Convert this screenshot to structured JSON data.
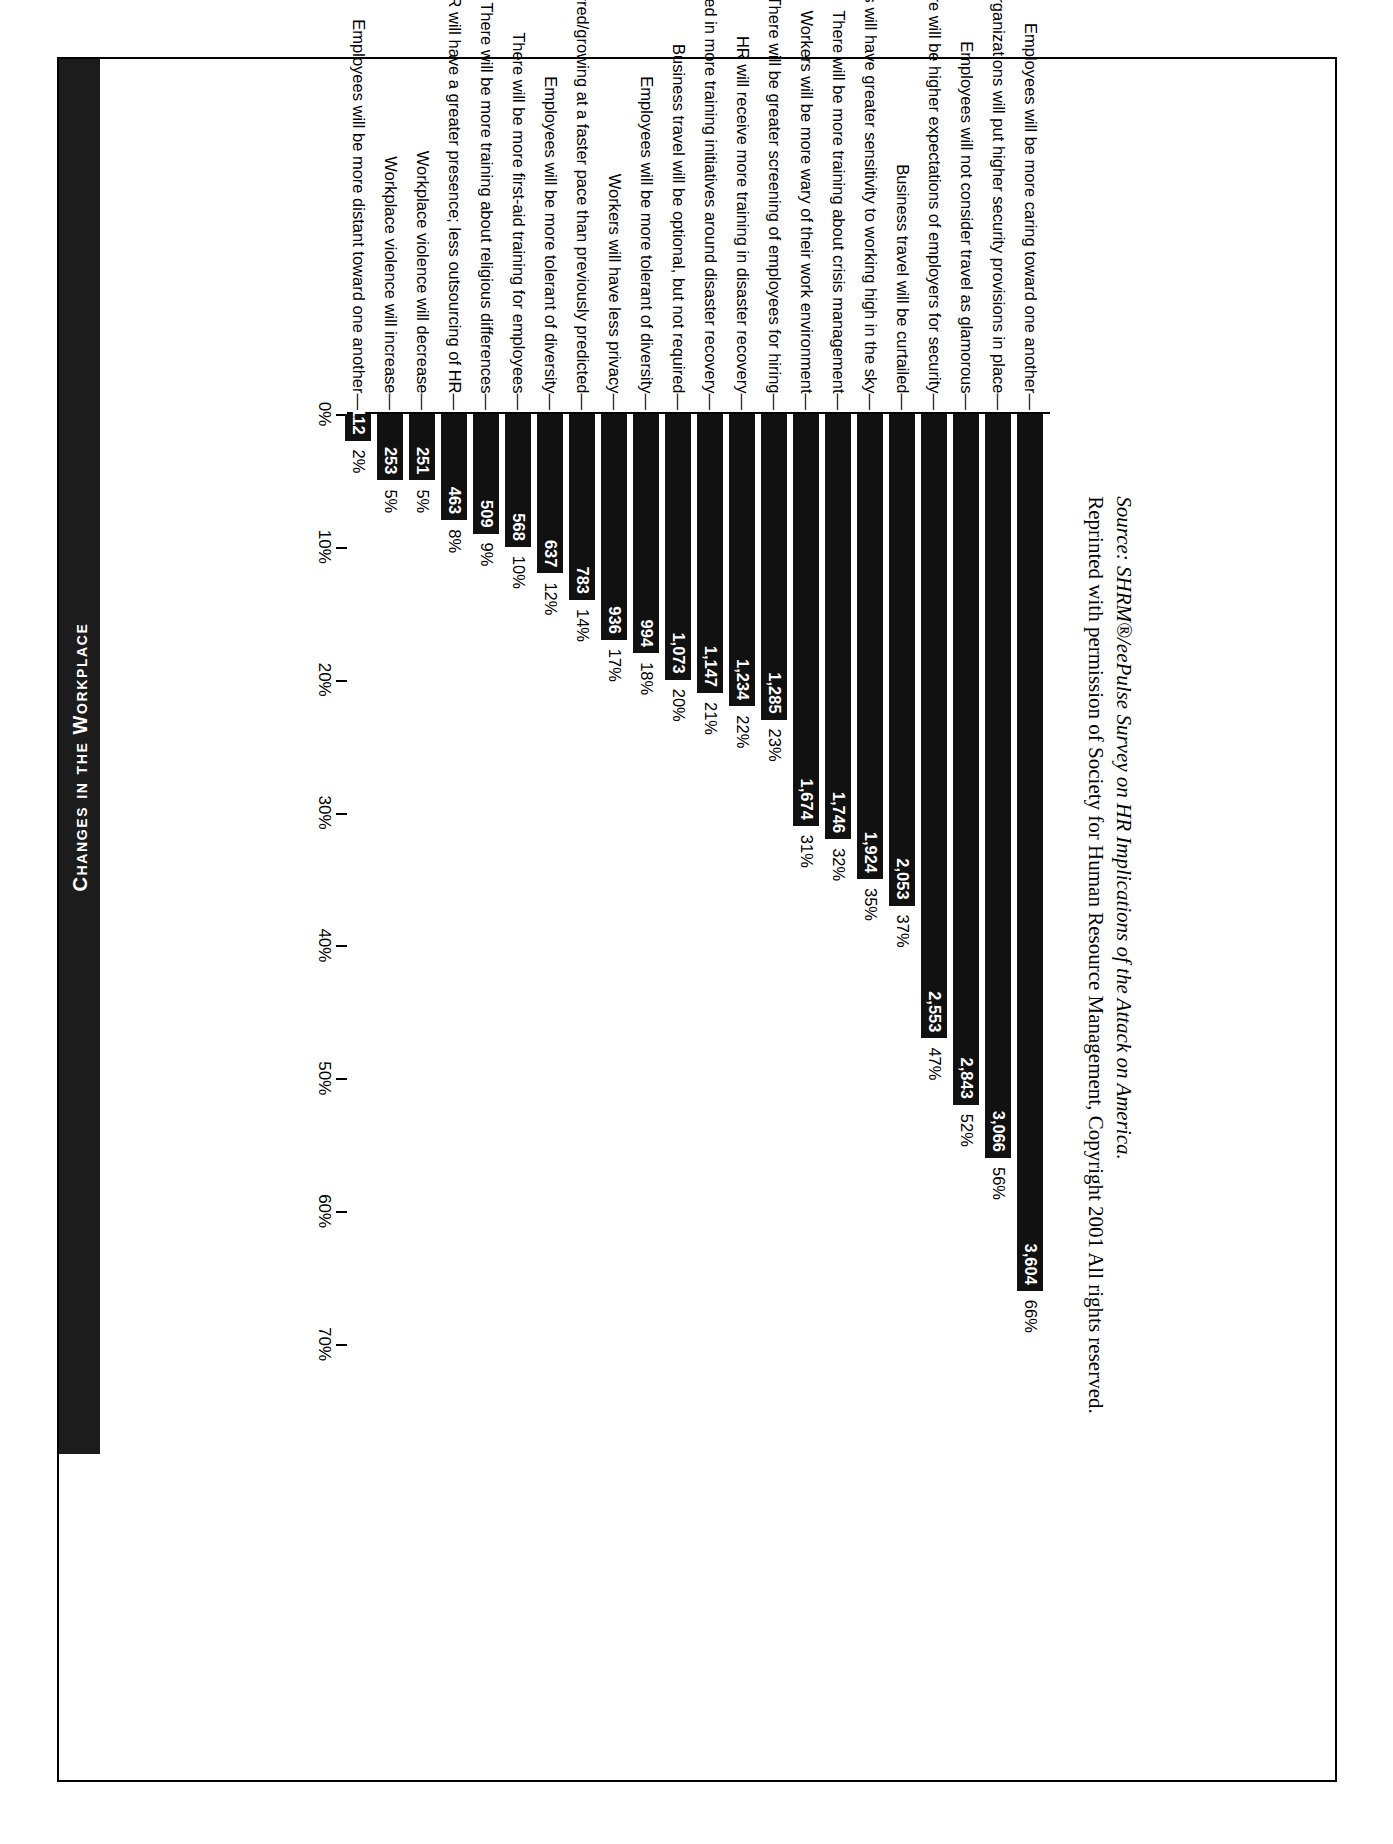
{
  "header": {
    "title": "Changes in the Workplace"
  },
  "source": {
    "line1": "Source: SHRM®/eePulse Survey on HR Implications of the Attack on America.",
    "line2": "Reprinted with permission of Society for Human Resource Management, Copyright 2001 All rights reserved."
  },
  "chart_data": {
    "type": "bar",
    "orientation": "horizontal",
    "title": "Changes in the Workplace",
    "xlabel": "",
    "ylabel": "",
    "xlim": [
      0,
      70
    ],
    "grid": false,
    "legend": null,
    "axis_ticks": [
      "0%",
      "10%",
      "20%",
      "30%",
      "40%",
      "50%",
      "60%",
      "70%"
    ],
    "axis_tick_values": [
      0,
      10,
      20,
      30,
      40,
      50,
      60,
      70
    ],
    "categories": [
      "Employees will be more caring toward one another",
      "Organizations will put higher security provisions in place",
      "Employees will not consider travel as glamorous",
      "There will be higher expectations of employers for security",
      "Business travel will be curtailed",
      "Workers will have greater sensitivity to working high in the sky",
      "There will be more training about crisis management",
      "Workers will be more wary of their work environment",
      "There will be greater screening of employees for hiring",
      "HR will receive more training in disaster recovery",
      "Leaders will be involved in more training initiatives around disaster recovery",
      "Business travel will be optional, but not required",
      "Employees will be more tolerant of diversity",
      "Workers will have less privacy",
      "Telecommuting preferred/growing at a faster pace than previously predicted",
      "Employees will be more tolerant of diversity",
      "There will be more first-aid training for employees",
      "There will be more training about religious differences",
      "HR will have a greater presence; less outsourcing of HR",
      "Workplace violence will decrease",
      "Workplace violence will increase",
      "Employees will be more distant toward one another"
    ],
    "values": [
      66,
      56,
      52,
      47,
      37,
      35,
      32,
      31,
      23,
      22,
      21,
      20,
      18,
      17,
      14,
      12,
      10,
      9,
      8,
      5,
      5,
      2
    ],
    "percent_labels": [
      "66%",
      "56%",
      "52%",
      "47%",
      "37%",
      "35%",
      "32%",
      "31%",
      "23%",
      "22%",
      "21%",
      "20%",
      "18%",
      "17%",
      "14%",
      "12%",
      "10%",
      "9%",
      "8%",
      "5%",
      "5%",
      "2%"
    ],
    "counts": [
      3604,
      3066,
      2843,
      2553,
      2053,
      1924,
      1746,
      1674,
      1285,
      1234,
      1147,
      1073,
      994,
      936,
      783,
      637,
      568,
      509,
      463,
      251,
      253,
      112
    ],
    "count_labels": [
      "3,604",
      "3,066",
      "2,843",
      "2,553",
      "2,053",
      "1,924",
      "1,746",
      "1,674",
      "1,285",
      "1,234",
      "1,147",
      "1,073",
      "994",
      "936",
      "783",
      "637",
      "568",
      "509",
      "463",
      "251",
      "253",
      "112"
    ]
  }
}
